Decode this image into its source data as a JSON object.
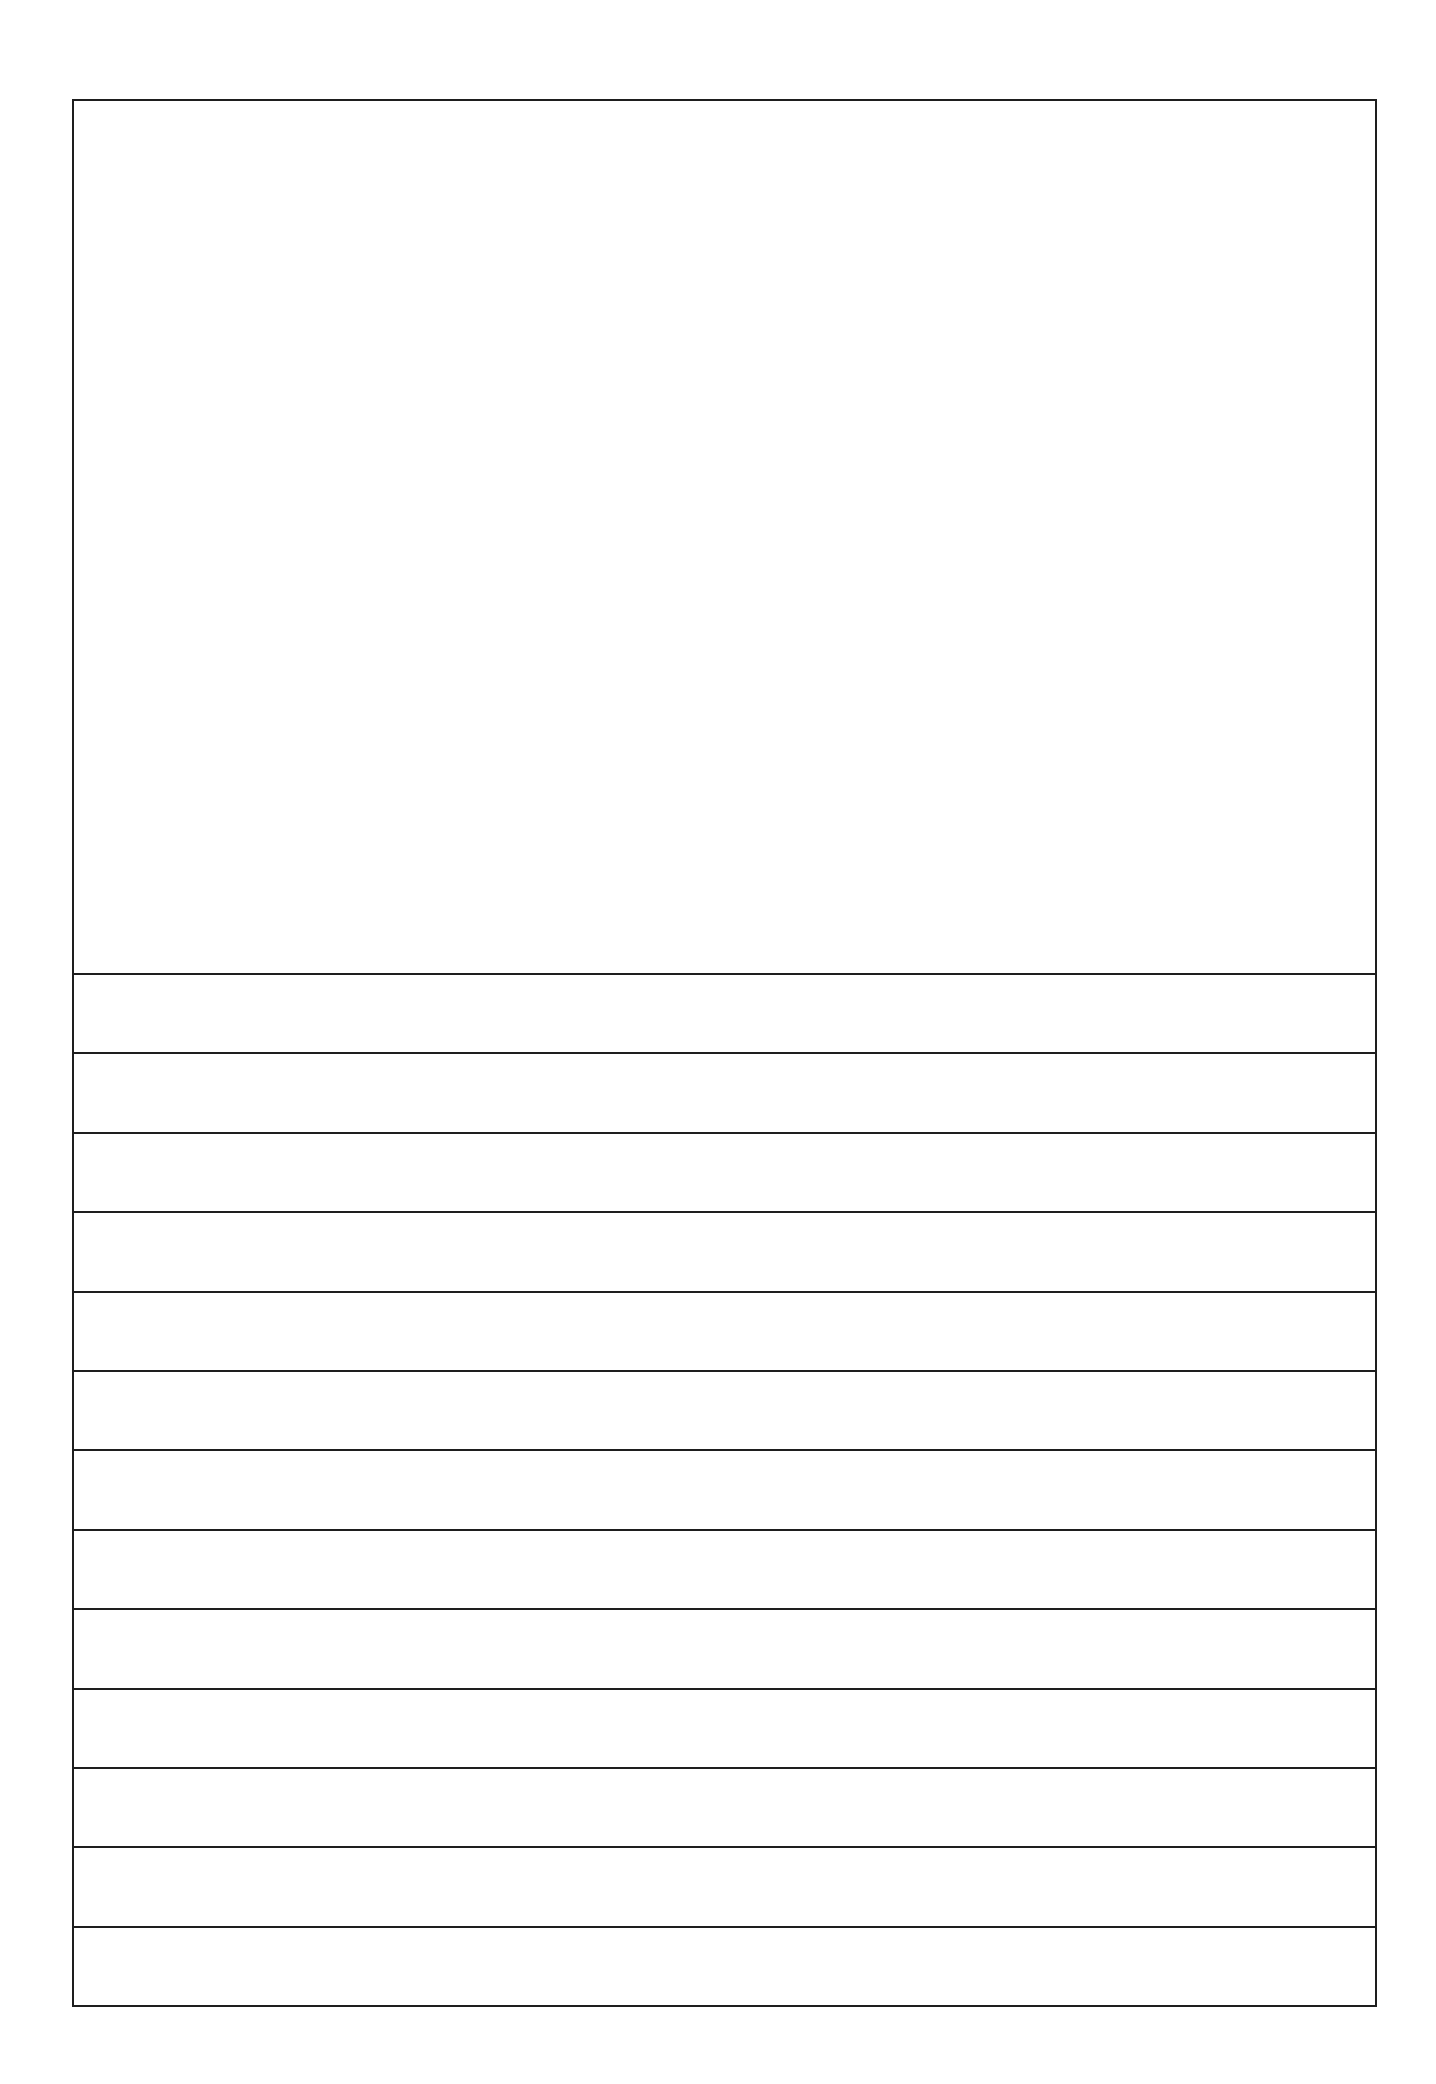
{
  "document": {
    "type": "story-paper-template",
    "drawing_area": {
      "label": ""
    },
    "writing_lines": {
      "count": 13,
      "lines": [
        "",
        "",
        "",
        "",
        "",
        "",
        "",
        "",
        "",
        "",
        "",
        "",
        ""
      ]
    },
    "colors": {
      "border": "#1e1e1e",
      "background": "#ffffff"
    }
  }
}
